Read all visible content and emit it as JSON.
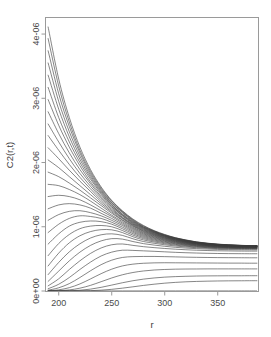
{
  "chart_data": {
    "type": "line",
    "title": "",
    "xlabel": "r",
    "ylabel": "C2(r,t)",
    "xlim": [
      188,
      388
    ],
    "ylim": [
      0,
      4.25e-06
    ],
    "xticks": [
      200,
      250,
      300,
      350
    ],
    "xtick_labels": [
      "200",
      "250",
      "300",
      "350"
    ],
    "yticks": [
      0,
      1e-06,
      2e-06,
      3e-06,
      4e-06
    ],
    "ytick_labels": [
      "0e+00",
      "1e-06",
      "2e-06",
      "3e-06",
      "4e-06"
    ],
    "grid": false,
    "legend": false,
    "legend_position": "none",
    "n_series": 31,
    "x": [
      190,
      200,
      210,
      220,
      230,
      240,
      250,
      260,
      270,
      280,
      290,
      300,
      310,
      320,
      330,
      340,
      350,
      360,
      370,
      380,
      387
    ],
    "series": [
      {
        "name": "t=0",
        "values": [
          0,
          0,
          0,
          0,
          0,
          0,
          0,
          0,
          0,
          0,
          0,
          0,
          0,
          0,
          0,
          0,
          0,
          0,
          0,
          0,
          0
        ]
      },
      {
        "name": "t=1",
        "values": [
          4.11e-06,
          3.3e-06,
          2.7e-06,
          2.24e-06,
          1.89e-06,
          1.62e-06,
          1.41e-06,
          1.25e-06,
          1.12e-06,
          1.02e-06,
          9.4e-07,
          8.8e-07,
          8.3e-07,
          7.95e-07,
          7.65e-07,
          7.45e-07,
          7.3e-07,
          7.2e-07,
          7.12e-07,
          7.07e-07,
          7.05e-07
        ]
      },
      {
        "name": "t=2",
        "values": [
          3.93e-06,
          3.19e-06,
          2.63e-06,
          2.19e-06,
          1.86e-06,
          1.6e-06,
          1.4e-06,
          1.24e-06,
          1.11e-06,
          1.01e-06,
          9.35e-07,
          8.75e-07,
          8.28e-07,
          7.92e-07,
          7.63e-07,
          7.43e-07,
          7.28e-07,
          7.18e-07,
          7.11e-07,
          7.06e-07,
          7.04e-07
        ]
      },
      {
        "name": "t=3",
        "values": [
          3.74e-06,
          3.07e-06,
          2.56e-06,
          2.15e-06,
          1.83e-06,
          1.58e-06,
          1.38e-06,
          1.23e-06,
          1.1e-06,
          1e-06,
          9.3e-07,
          8.7e-07,
          8.25e-07,
          7.89e-07,
          7.61e-07,
          7.41e-07,
          7.27e-07,
          7.17e-07,
          7.1e-07,
          7.05e-07,
          7.03e-07
        ]
      },
      {
        "name": "t=4",
        "values": [
          3.55e-06,
          2.95e-06,
          2.48e-06,
          2.1e-06,
          1.8e-06,
          1.56e-06,
          1.37e-06,
          1.22e-06,
          1.09e-06,
          9.95e-07,
          9.25e-07,
          8.66e-07,
          8.21e-07,
          7.86e-07,
          7.59e-07,
          7.39e-07,
          7.25e-07,
          7.16e-07,
          7.09e-07,
          7.04e-07,
          7.02e-07
        ]
      },
      {
        "name": "t=5",
        "values": [
          3.36e-06,
          2.83e-06,
          2.4e-06,
          2.05e-06,
          1.77e-06,
          1.54e-06,
          1.35e-06,
          1.2e-06,
          1.08e-06,
          9.88e-07,
          9.19e-07,
          8.62e-07,
          8.17e-07,
          7.83e-07,
          7.56e-07,
          7.37e-07,
          7.23e-07,
          7.14e-07,
          7.07e-07,
          7.03e-07,
          7.01e-07
        ]
      },
      {
        "name": "t=6",
        "values": [
          3.17e-06,
          2.7e-06,
          2.32e-06,
          2e-06,
          1.74e-06,
          1.52e-06,
          1.34e-06,
          1.19e-06,
          1.07e-06,
          9.8e-07,
          9.13e-07,
          8.57e-07,
          8.13e-07,
          7.8e-07,
          7.54e-07,
          7.35e-07,
          7.21e-07,
          7.12e-07,
          7.06e-07,
          7.02e-07,
          7e-07
        ]
      },
      {
        "name": "t=7",
        "values": [
          2.98e-06,
          2.58e-06,
          2.24e-06,
          1.95e-06,
          1.7e-06,
          1.5e-06,
          1.32e-06,
          1.18e-06,
          1.06e-06,
          9.72e-07,
          9.07e-07,
          8.52e-07,
          8.09e-07,
          7.76e-07,
          7.51e-07,
          7.32e-07,
          7.19e-07,
          7.1e-07,
          7.04e-07,
          7e-07,
          6.99e-07
        ]
      },
      {
        "name": "t=8",
        "values": [
          2.79e-06,
          2.45e-06,
          2.15e-06,
          1.89e-06,
          1.67e-06,
          1.47e-06,
          1.31e-06,
          1.17e-06,
          1.05e-06,
          9.63e-07,
          9e-07,
          8.47e-07,
          8.05e-07,
          7.73e-07,
          7.48e-07,
          7.3e-07,
          7.17e-07,
          7.08e-07,
          7.02e-07,
          6.99e-07,
          6.97e-07
        ]
      },
      {
        "name": "t=9",
        "values": [
          2.6e-06,
          2.32e-06,
          2.06e-06,
          1.83e-06,
          1.63e-06,
          1.45e-06,
          1.29e-06,
          1.15e-06,
          1.04e-06,
          9.54e-07,
          8.93e-07,
          8.41e-07,
          8e-07,
          7.69e-07,
          7.45e-07,
          7.27e-07,
          7.14e-07,
          7.06e-07,
          7e-07,
          6.97e-07,
          6.96e-07
        ]
      },
      {
        "name": "t=10",
        "values": [
          2.42e-06,
          2.19e-06,
          1.97e-06,
          1.77e-06,
          1.59e-06,
          1.42e-06,
          1.27e-06,
          1.14e-06,
          1.03e-06,
          9.45e-07,
          8.85e-07,
          8.35e-07,
          7.96e-07,
          7.65e-07,
          7.42e-07,
          7.24e-07,
          7.12e-07,
          7.04e-07,
          6.98e-07,
          6.95e-07,
          6.94e-07
        ]
      },
      {
        "name": "t=11",
        "values": [
          2.23e-06,
          2.06e-06,
          1.88e-06,
          1.71e-06,
          1.55e-06,
          1.39e-06,
          1.25e-06,
          1.13e-06,
          1.02e-06,
          9.35e-07,
          8.78e-07,
          8.29e-07,
          7.91e-07,
          7.61e-07,
          7.38e-07,
          7.21e-07,
          7.09e-07,
          7.01e-07,
          6.96e-07,
          6.93e-07,
          6.92e-07
        ]
      },
      {
        "name": "t=12",
        "values": [
          2.04e-06,
          1.92e-06,
          1.78e-06,
          1.64e-06,
          1.5e-06,
          1.36e-06,
          1.23e-06,
          1.11e-06,
          1.01e-06,
          9.25e-07,
          8.7e-07,
          8.23e-07,
          7.86e-07,
          7.57e-07,
          7.35e-07,
          7.18e-07,
          7.07e-07,
          6.99e-07,
          6.94e-07,
          6.91e-07,
          6.9e-07
        ]
      },
      {
        "name": "t=13",
        "values": [
          1.85e-06,
          1.78e-06,
          1.68e-06,
          1.57e-06,
          1.45e-06,
          1.33e-06,
          1.21e-06,
          1.1e-06,
          9.95e-07,
          9.14e-07,
          8.61e-07,
          8.16e-07,
          7.8e-07,
          7.52e-07,
          7.31e-07,
          7.15e-07,
          7.04e-07,
          6.96e-07,
          6.91e-07,
          6.88e-07,
          6.87e-07
        ]
      },
      {
        "name": "t=14",
        "values": [
          1.66e-06,
          1.64e-06,
          1.58e-06,
          1.5e-06,
          1.4e-06,
          1.29e-06,
          1.18e-06,
          1.08e-06,
          9.8e-07,
          9.02e-07,
          8.52e-07,
          8.08e-07,
          7.74e-07,
          7.47e-07,
          7.27e-07,
          7.11e-07,
          7.01e-07,
          6.93e-07,
          6.88e-07,
          6.86e-07,
          6.85e-07
        ]
      },
      {
        "name": "t=15",
        "values": [
          1.47e-06,
          1.49e-06,
          1.47e-06,
          1.42e-06,
          1.34e-06,
          1.25e-06,
          1.16e-06,
          1.06e-06,
          9.65e-07,
          8.9e-07,
          8.42e-07,
          8e-07,
          7.68e-07,
          7.42e-07,
          7.22e-07,
          7.07e-07,
          6.97e-07,
          6.9e-07,
          6.85e-07,
          6.83e-07,
          6.82e-07
        ]
      },
      {
        "name": "t=16",
        "values": [
          1.28e-06,
          1.34e-06,
          1.36e-06,
          1.34e-06,
          1.29e-06,
          1.21e-06,
          1.13e-06,
          1.04e-06,
          9.48e-07,
          8.77e-07,
          8.31e-07,
          7.92e-07,
          7.61e-07,
          7.36e-07,
          7.17e-07,
          7.03e-07,
          6.93e-07,
          6.87e-07,
          6.82e-07,
          6.8e-07,
          6.79e-07
        ]
      },
      {
        "name": "t=17",
        "values": [
          1.1e-06,
          1.19e-06,
          1.24e-06,
          1.25e-06,
          1.22e-06,
          1.17e-06,
          1.1e-06,
          1.02e-06,
          9.3e-07,
          8.63e-07,
          8.2e-07,
          7.83e-07,
          7.53e-07,
          7.3e-07,
          7.12e-07,
          6.99e-07,
          6.89e-07,
          6.83e-07,
          6.79e-07,
          6.77e-07,
          6.76e-07
        ]
      },
      {
        "name": "t=18",
        "values": [
          9.1e-07,
          1.04e-06,
          1.13e-06,
          1.17e-06,
          1.16e-06,
          1.13e-06,
          1.07e-06,
          9.95e-07,
          9.12e-07,
          8.48e-07,
          8.07e-07,
          7.73e-07,
          7.45e-07,
          7.23e-07,
          7.06e-07,
          6.94e-07,
          6.85e-07,
          6.79e-07,
          6.75e-07,
          6.73e-07,
          6.72e-07
        ]
      },
      {
        "name": "t=19",
        "values": [
          7.3e-07,
          8.9e-07,
          1.01e-06,
          1.07e-06,
          1.09e-06,
          1.08e-06,
          1.04e-06,
          9.7e-07,
          8.92e-07,
          8.32e-07,
          7.94e-07,
          7.62e-07,
          7.36e-07,
          7.16e-07,
          7e-07,
          6.88e-07,
          6.8e-07,
          6.75e-07,
          6.71e-07,
          6.69e-07,
          6.68e-07
        ]
      },
      {
        "name": "t=20",
        "values": [
          5.5e-07,
          7.4e-07,
          8.8e-07,
          9.7e-07,
          1.01e-06,
          1.02e-06,
          1e-06,
          9.42e-07,
          8.7e-07,
          8.15e-07,
          7.79e-07,
          7.5e-07,
          7.26e-07,
          7.07e-07,
          6.93e-07,
          6.82e-07,
          6.75e-07,
          6.7e-07,
          6.67e-07,
          6.65e-07,
          6.64e-07
        ]
      },
      {
        "name": "t=21",
        "values": [
          3.9e-07,
          5.9e-07,
          7.5e-07,
          8.6e-07,
          9.25e-07,
          9.55e-07,
          9.52e-07,
          9.1e-07,
          8.45e-07,
          7.95e-07,
          7.63e-07,
          7.36e-07,
          7.14e-07,
          6.97e-07,
          6.84e-07,
          6.75e-07,
          6.68e-07,
          6.64e-07,
          6.61e-07,
          6.6e-07,
          6.59e-07
        ]
      },
      {
        "name": "t=22",
        "values": [
          2.55e-07,
          4.45e-07,
          6.1e-07,
          7.35e-07,
          8.25e-07,
          8.75e-07,
          8.9e-07,
          8.66e-07,
          8.13e-07,
          7.7e-07,
          7.43e-07,
          7.19e-07,
          7e-07,
          6.85e-07,
          6.74e-07,
          6.66e-07,
          6.6e-07,
          6.56e-07,
          6.54e-07,
          6.53e-07,
          6.52e-07
        ]
      },
      {
        "name": "t=23",
        "values": [
          1.5e-07,
          3.1e-07,
          4.7e-07,
          6.05e-07,
          7.1e-07,
          7.8e-07,
          8.15e-07,
          8.08e-07,
          7.7e-07,
          7.37e-07,
          7.15e-07,
          6.96e-07,
          6.8e-07,
          6.68e-07,
          6.59e-07,
          6.52e-07,
          6.47e-07,
          6.44e-07,
          6.42e-07,
          6.41e-07,
          6.4e-07
        ]
      },
      {
        "name": "t=24",
        "values": [
          8e-08,
          1.9e-07,
          3.35e-07,
          4.7e-07,
          5.85e-07,
          6.7e-07,
          7.2e-07,
          7.32e-07,
          7.1e-07,
          6.9e-07,
          6.75e-07,
          6.62e-07,
          6.51e-07,
          6.42e-07,
          6.35e-07,
          6.3e-07,
          6.26e-07,
          6.24e-07,
          6.22e-07,
          6.21e-07,
          6.21e-07
        ]
      },
      {
        "name": "t=25",
        "values": [
          3.5e-08,
          1.05e-07,
          2.1e-07,
          3.35e-07,
          4.5e-07,
          5.45e-07,
          6.05e-07,
          6.35e-07,
          6.32e-07,
          6.25e-07,
          6.18e-07,
          6.1e-07,
          6.02e-07,
          5.96e-07,
          5.91e-07,
          5.87e-07,
          5.84e-07,
          5.82e-07,
          5.81e-07,
          5.8e-07,
          5.8e-07
        ]
      },
      {
        "name": "t=26",
        "values": [
          1.2e-08,
          5e-08,
          1.15e-07,
          2.1e-07,
          3.15e-07,
          4.1e-07,
          4.8e-07,
          5.22e-07,
          5.35e-07,
          5.38e-07,
          5.38e-07,
          5.35e-07,
          5.31e-07,
          5.27e-07,
          5.24e-07,
          5.22e-07,
          5.2e-07,
          5.19e-07,
          5.18e-07,
          5.17e-07,
          5.17e-07
        ]
      },
      {
        "name": "t=27",
        "values": [
          3e-09,
          1.8e-08,
          5.2e-08,
          1.1e-07,
          1.88e-07,
          2.7e-07,
          3.4e-07,
          3.9e-07,
          4.18e-07,
          4.32e-07,
          4.38e-07,
          4.4e-07,
          4.39e-07,
          4.38e-07,
          4.37e-07,
          4.36e-07,
          4.35e-07,
          4.34e-07,
          4.34e-07,
          4.33e-07,
          4.33e-07
        ]
      },
      {
        "name": "t=28",
        "values": [
          5e-10,
          4.5e-09,
          1.7e-08,
          4.4e-08,
          8.8e-08,
          1.45e-07,
          2.03e-07,
          2.52e-07,
          2.88e-07,
          3.12e-07,
          3.27e-07,
          3.35e-07,
          3.4e-07,
          3.42e-07,
          3.43e-07,
          3.44e-07,
          3.44e-07,
          3.44e-07,
          3.44e-07,
          3.44e-07,
          3.44e-07
        ]
      },
      {
        "name": "t=29",
        "values": [
          5e-11,
          7e-10,
          3.6e-09,
          1.2e-08,
          2.9e-08,
          5.7e-08,
          9.2e-08,
          1.28e-07,
          1.6e-07,
          1.85e-07,
          2.03e-07,
          2.16e-07,
          2.24e-07,
          2.29e-07,
          2.33e-07,
          2.35e-07,
          2.36e-07,
          2.37e-07,
          2.37e-07,
          2.38e-07,
          2.38e-07
        ]
      },
      {
        "name": "t=30",
        "values": [
          2e-12,
          5e-11,
          3.5e-10,
          1.6e-09,
          5.2e-09,
          1.3e-08,
          2.6e-08,
          4.4e-08,
          6.5e-08,
          8.7e-08,
          1.06e-07,
          1.22e-07,
          1.34e-07,
          1.43e-07,
          1.49e-07,
          1.53e-07,
          1.56e-07,
          1.58e-07,
          1.59e-07,
          1.6e-07,
          1.6e-07
        ]
      }
    ]
  },
  "colors": {
    "curve": "#3a3a3a",
    "axis": "#9a9a9a",
    "text": "#4a4a4a",
    "background": "#ffffff"
  }
}
